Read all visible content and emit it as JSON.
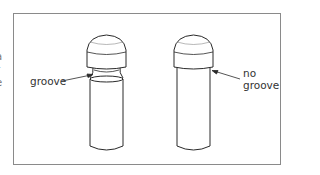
{
  "figure": {
    "clipped_left_text": [
      "a",
      "r",
      "e"
    ],
    "pins": [
      {
        "id": "left",
        "label": "groove",
        "has_groove": true
      },
      {
        "id": "right",
        "label_lines": [
          "no",
          "groove"
        ],
        "has_groove": false
      }
    ],
    "colors": {
      "line": "#2a2a2a",
      "frame": "#8a8a8a",
      "text": "#333333"
    }
  }
}
